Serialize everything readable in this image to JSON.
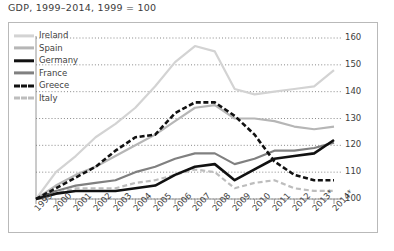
{
  "title": "GDP, 1999–2014, 1999 = 100",
  "axis": {
    "y_ticks": [
      "100",
      "110",
      "120",
      "130",
      "140",
      "150",
      "160"
    ],
    "x_ticks": [
      "1999",
      "2000",
      "2001",
      "2002",
      "2003",
      "2004",
      "2005",
      "2006",
      "2007",
      "2008",
      "2009",
      "2010",
      "2011",
      "2012",
      "2013*",
      "2014*"
    ]
  },
  "legend": {
    "items": [
      {
        "label": "Ireland",
        "color": "#d3d3d3",
        "style": "solid",
        "width": 3.2
      },
      {
        "label": "Spain",
        "color": "#b6b6b6",
        "style": "solid",
        "width": 3.2
      },
      {
        "label": "Germany",
        "color": "#111111",
        "style": "solid",
        "width": 3.4
      },
      {
        "label": "France",
        "color": "#808080",
        "style": "solid",
        "width": 3.2
      },
      {
        "label": "Greece",
        "color": "#111111",
        "style": "dashed",
        "width": 3.4
      },
      {
        "label": "Italy",
        "color": "#bdbdbd",
        "style": "dashed",
        "width": 3.2
      }
    ]
  },
  "chart_data": {
    "type": "line",
    "title": "GDP, 1999–2014, 1999 = 100",
    "xlabel": "",
    "ylabel": "Index (1999 = 100)",
    "ylim": [
      100,
      160
    ],
    "grid": true,
    "y_ticks": [
      100,
      110,
      120,
      130,
      140,
      150,
      160
    ],
    "legend_position": "top-left",
    "note": "2013 and 2014 values are forecasts (marked *)",
    "x": [
      "1999",
      "2000",
      "2001",
      "2002",
      "2003",
      "2004",
      "2005",
      "2006",
      "2007",
      "2008",
      "2009",
      "2010",
      "2011",
      "2012",
      "2013*",
      "2014*"
    ],
    "series": [
      {
        "name": "Ireland",
        "color": "#d3d3d3",
        "style": "solid",
        "values": [
          100,
          110,
          116,
          123,
          128,
          134,
          142,
          151,
          157,
          155,
          141,
          139,
          140,
          141,
          142,
          148
        ]
      },
      {
        "name": "Spain",
        "color": "#b6b6b6",
        "style": "solid",
        "values": [
          100,
          105,
          109,
          112,
          116,
          120,
          124,
          129,
          134,
          135,
          130,
          130,
          129,
          127,
          126,
          127
        ]
      },
      {
        "name": "Germany",
        "color": "#111111",
        "style": "solid",
        "values": [
          100,
          102,
          103,
          103,
          103,
          104,
          105,
          109,
          112,
          113,
          107,
          111,
          115,
          116,
          117,
          122
        ]
      },
      {
        "name": "France",
        "color": "#808080",
        "style": "solid",
        "values": [
          100,
          103,
          105,
          106,
          107,
          110,
          112,
          115,
          117,
          117,
          113,
          115,
          118,
          118,
          119,
          121
        ]
      },
      {
        "name": "Greece",
        "color": "#111111",
        "style": "dashed",
        "values": [
          100,
          104,
          108,
          112,
          118,
          123,
          124,
          132,
          136,
          136,
          131,
          124,
          114,
          109,
          107,
          107
        ]
      },
      {
        "name": "Italy",
        "color": "#bdbdbd",
        "style": "dashed",
        "values": [
          100,
          102,
          104,
          104,
          104,
          106,
          107,
          109,
          111,
          110,
          104,
          106,
          107,
          104,
          103,
          103
        ]
      }
    ]
  }
}
